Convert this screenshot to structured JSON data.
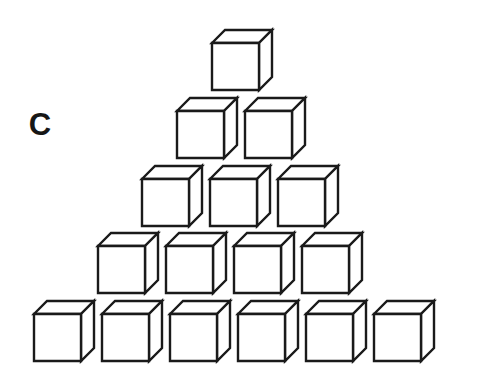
{
  "figure": {
    "panel_label": "C",
    "label_position": {
      "x": 40,
      "y": 127
    },
    "background_color": "#ffffff",
    "stroke_color": "#1a1a1a",
    "face_fill_color": "#ffffff",
    "stroke_width": 2.4,
    "total_cube_count": 16,
    "icon_names": {
      "panel_label": "panel-label-c",
      "cube": "cube-icon",
      "stack": "cube-pyramid-stack"
    }
  },
  "chart_data": {
    "type": "bar",
    "title": "",
    "subtitle": "",
    "xlabel": "",
    "ylabel": "",
    "categories": [
      "row-5",
      "row-4",
      "row-3",
      "row-2",
      "row-1"
    ],
    "values": [
      1,
      2,
      3,
      4,
      6
    ],
    "ylim": [
      0,
      6
    ],
    "grid": false,
    "legend": null,
    "annotations": [
      "C"
    ]
  },
  "cube_geometry": {
    "front_width": 47,
    "front_height": 47,
    "depth_dx": 13,
    "depth_dy": 13
  },
  "rows": [
    {
      "name": "row-top",
      "count": 1,
      "pitch": 68,
      "cubes": [
        {
          "x": 212,
          "y": 43
        }
      ]
    },
    {
      "name": "row-second",
      "count": 2,
      "pitch": 68,
      "cubes": [
        {
          "x": 177,
          "y": 111
        },
        {
          "x": 245,
          "y": 111
        }
      ]
    },
    {
      "name": "row-third",
      "count": 3,
      "pitch": 68,
      "cubes": [
        {
          "x": 142,
          "y": 179
        },
        {
          "x": 210,
          "y": 179
        },
        {
          "x": 278,
          "y": 179
        }
      ]
    },
    {
      "name": "row-fourth",
      "count": 4,
      "pitch": 68,
      "cubes": [
        {
          "x": 98,
          "y": 246
        },
        {
          "x": 166,
          "y": 246
        },
        {
          "x": 234,
          "y": 246
        },
        {
          "x": 302,
          "y": 246
        }
      ]
    },
    {
      "name": "row-bottom",
      "count": 6,
      "pitch": 68,
      "cubes": [
        {
          "x": 34,
          "y": 314
        },
        {
          "x": 102,
          "y": 314
        },
        {
          "x": 170,
          "y": 314
        },
        {
          "x": 238,
          "y": 314
        },
        {
          "x": 306,
          "y": 314
        },
        {
          "x": 374,
          "y": 314
        }
      ]
    }
  ]
}
